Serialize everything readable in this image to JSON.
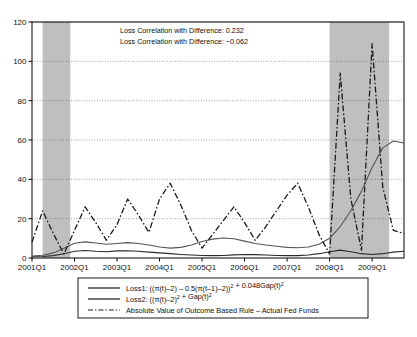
{
  "chart_data": {
    "type": "line",
    "title": "",
    "xlabel": "",
    "ylabel": "",
    "ylim": [
      0,
      120
    ],
    "y_ticks": [
      0,
      20,
      40,
      60,
      80,
      100,
      120
    ],
    "grid": true,
    "legend_position": "below-plot",
    "x_tick_labels": [
      "2001Q1",
      "2002Q1",
      "2003Q1",
      "2004Q1",
      "2005Q1",
      "2006Q1",
      "2007Q1",
      "2008Q1",
      "2009Q1"
    ],
    "x_tick_indices": [
      0,
      4,
      8,
      12,
      16,
      20,
      24,
      28,
      32
    ],
    "x": [
      "2001Q1",
      "2001Q2",
      "2001Q3",
      "2001Q4",
      "2002Q1",
      "2002Q2",
      "2002Q3",
      "2002Q4",
      "2003Q1",
      "2003Q2",
      "2003Q3",
      "2003Q4",
      "2004Q1",
      "2004Q2",
      "2004Q3",
      "2004Q4",
      "2005Q1",
      "2005Q2",
      "2005Q3",
      "2005Q4",
      "2006Q1",
      "2006Q2",
      "2006Q3",
      "2006Q4",
      "2007Q1",
      "2007Q2",
      "2007Q3",
      "2007Q4",
      "2008Q1",
      "2008Q2",
      "2008Q3",
      "2008Q4",
      "2009Q1",
      "2009Q2",
      "2009Q3",
      "2009Q4"
    ],
    "series": [
      {
        "name": "Loss1",
        "style": "solid",
        "color": "#2b2b2b",
        "width": 1.1,
        "values": [
          0.6,
          0.8,
          1.2,
          2.2,
          3.4,
          3.8,
          3.4,
          3.2,
          3.6,
          3.7,
          3.4,
          3.0,
          2.6,
          2.2,
          1.8,
          1.5,
          1.3,
          1.2,
          1.3,
          1.6,
          1.8,
          1.7,
          1.5,
          1.3,
          1.2,
          1.2,
          1.5,
          2.2,
          3.2,
          4.0,
          3.2,
          2.2,
          1.8,
          2.2,
          3.0,
          3.4
        ]
      },
      {
        "name": "Loss2",
        "style": "solid",
        "color": "#555555",
        "width": 1.1,
        "values": [
          1.0,
          1.4,
          2.6,
          5.0,
          7.5,
          8.2,
          7.6,
          7.0,
          7.4,
          7.8,
          7.4,
          6.6,
          5.6,
          5.0,
          5.4,
          6.6,
          8.4,
          9.6,
          10.2,
          9.8,
          8.6,
          7.4,
          6.6,
          6.0,
          5.4,
          5.2,
          5.6,
          7.0,
          10.0,
          16.0,
          24.0,
          34.0,
          46.0,
          56.0,
          59.5,
          58.5
        ]
      },
      {
        "name": "AbsDiff",
        "style": "dashdot",
        "color": "#1a1a1a",
        "width": 1.3,
        "values": [
          8.0,
          24.0,
          12.5,
          2.0,
          14.0,
          26.0,
          18.0,
          9.0,
          17.0,
          30.0,
          22.0,
          13.0,
          30.0,
          38.0,
          27.0,
          14.0,
          5.0,
          12.0,
          19.0,
          26.0,
          18.0,
          9.0,
          16.0,
          24.0,
          32.0,
          38.0,
          26.0,
          12.0,
          2.0,
          94.0,
          30.0,
          4.0,
          109.0,
          36.0,
          14.0,
          12.5
        ]
      }
    ],
    "shaded_bands": [
      {
        "label": "recession-2001",
        "start_index": 1.0,
        "end_index": 3.6
      },
      {
        "label": "recession-2008",
        "start_index": 28.0,
        "end_index": 33.6
      }
    ],
    "shaded_band_color": "#bfbfbf",
    "annotations": [
      "Loss Correlation with Difference: 0.232",
      "Loss Correlation with Difference: −0.062"
    ]
  },
  "legend": {
    "entries": [
      {
        "marker": "solid",
        "text": "Loss1: ((π(t)–2) – 0.5(π(t–1)–2))² + 0.048Gap(t)²"
      },
      {
        "marker": "solid",
        "text": "Loss2: ((π(t)–2)² + Gap(t)²"
      },
      {
        "marker": "dashdot",
        "text": "Absolute Value of Outcome Based Rule – Actual Fed Funds"
      }
    ]
  }
}
